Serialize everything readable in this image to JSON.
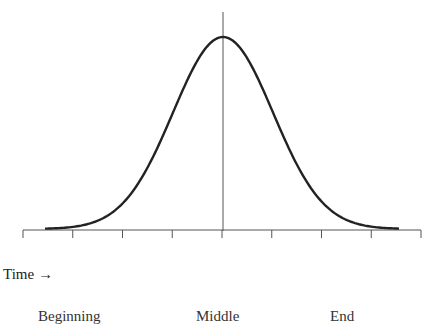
{
  "chart_data": {
    "type": "line",
    "title": "",
    "xlabel": "Time →",
    "ylabel": "",
    "x": [
      -4,
      -3.5,
      -3,
      -2.5,
      -2,
      -1.5,
      -1,
      -0.5,
      0,
      0.5,
      1,
      1.5,
      2,
      2.5,
      3,
      3.5
    ],
    "series": [
      {
        "name": "curve",
        "values": [
          0.0003,
          0.0022,
          0.011,
          0.044,
          0.135,
          0.325,
          0.607,
          0.882,
          1.0,
          0.882,
          0.607,
          0.325,
          0.135,
          0.044,
          0.011,
          0.0022
        ]
      }
    ],
    "tick_count": 9,
    "tick_labels": [],
    "phase_labels": [
      "Beginning",
      "Middle",
      "End"
    ],
    "center_line": true,
    "grid": false,
    "legend": null
  },
  "labels": {
    "time_axis": "Time →",
    "phases": [
      "Beginning",
      "Middle",
      "End"
    ]
  },
  "colors": {
    "line": "#222222",
    "axis": "#555555"
  }
}
